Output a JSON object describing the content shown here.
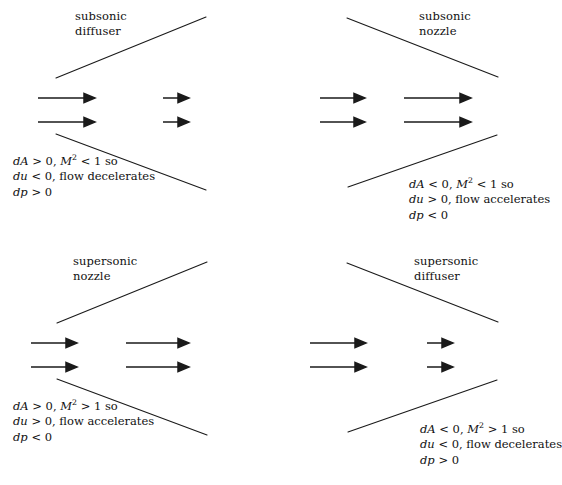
{
  "figure": {
    "background": "#ffffff",
    "line_color": "#1a1a1a",
    "text_color": "#111111"
  },
  "panels": [
    {
      "id": "subsonic-diffuser",
      "title_line1": "subsonic",
      "title_line2": "diffuser",
      "shape": "diverging",
      "inlet_arrows": "long",
      "outlet_arrows": "short",
      "caption_align": "left",
      "caption": {
        "line1_prefix": "dA",
        "line1_rel1": "> 0,",
        "line1_sym": "M",
        "line1_exp": "2",
        "line1_rel2": "< 1 so",
        "line2_sym": "du",
        "line2_rel": "< 0,",
        "line2_text": "flow decelerates",
        "line3_sym": "dp",
        "line3_rel": "> 0"
      }
    },
    {
      "id": "subsonic-nozzle",
      "title_line1": "subsonic",
      "title_line2": "nozzle",
      "shape": "converging",
      "inlet_arrows": "medium",
      "outlet_arrows": "long",
      "caption_align": "right",
      "caption": {
        "line1_prefix": "dA",
        "line1_rel1": "< 0,",
        "line1_sym": "M",
        "line1_exp": "2",
        "line1_rel2": "< 1 so",
        "line2_sym": "du",
        "line2_rel": "> 0,",
        "line2_text": "flow accelerates",
        "line3_sym": "dp",
        "line3_rel": "< 0"
      }
    },
    {
      "id": "supersonic-nozzle",
      "title_line1": "supersonic",
      "title_line2": "nozzle",
      "shape": "diverging",
      "inlet_arrows": "medium",
      "outlet_arrows": "long",
      "caption_align": "left",
      "caption": {
        "line1_prefix": "dA",
        "line1_rel1": "> 0,",
        "line1_sym": "M",
        "line1_exp": "2",
        "line1_rel2": "> 1 so",
        "line2_sym": "du",
        "line2_rel": "> 0,",
        "line2_text": "flow accelerates",
        "line3_sym": "dp",
        "line3_rel": "< 0"
      }
    },
    {
      "id": "supersonic-diffuser",
      "title_line1": "supersonic",
      "title_line2": "diffuser",
      "shape": "converging",
      "inlet_arrows": "long",
      "outlet_arrows": "short",
      "caption_align": "right",
      "caption": {
        "line1_prefix": "dA",
        "line1_rel1": "< 0,",
        "line1_sym": "M",
        "line1_exp": "2",
        "line1_rel2": "> 1 so",
        "line2_sym": "du",
        "line2_rel": "< 0,",
        "line2_text": "flow decelerates",
        "line3_sym": "dp",
        "line3_rel": "> 0"
      }
    }
  ]
}
